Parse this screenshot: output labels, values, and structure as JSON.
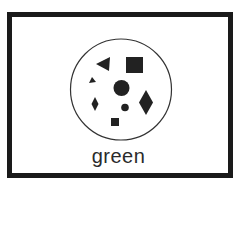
{
  "card": {
    "label": "green",
    "border_color": "#1a1a1a",
    "shape_color": "#222222"
  },
  "shapes": [
    {
      "type": "triangle-left",
      "name": "large-triangle"
    },
    {
      "type": "square",
      "name": "large-square"
    },
    {
      "type": "triangle-left",
      "name": "small-triangle"
    },
    {
      "type": "circle",
      "name": "large-circle"
    },
    {
      "type": "diamond",
      "name": "small-diamond"
    },
    {
      "type": "circle",
      "name": "small-circle"
    },
    {
      "type": "diamond",
      "name": "large-diamond"
    },
    {
      "type": "square",
      "name": "small-square"
    }
  ]
}
